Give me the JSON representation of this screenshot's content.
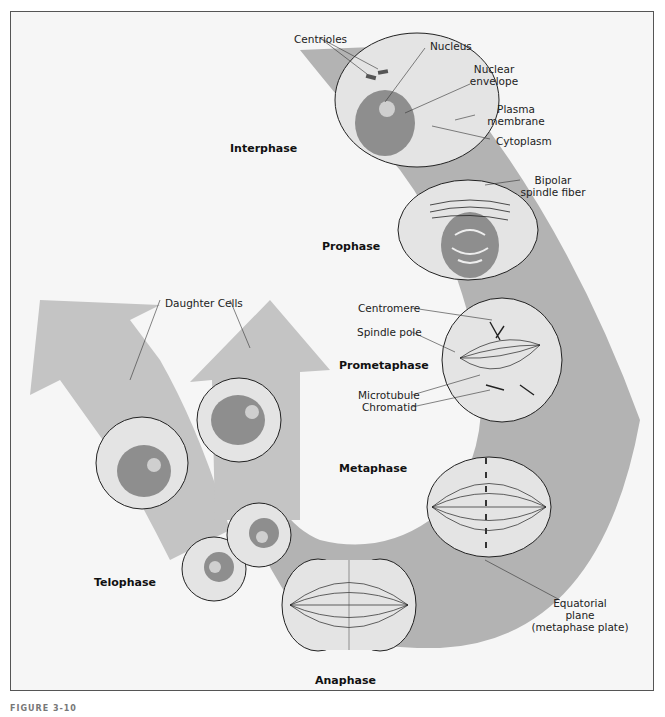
{
  "figure": {
    "caption": "FIGURE 3-10",
    "colors": {
      "background": "#f6f6f6",
      "band": "#b3b3b3",
      "arrow": "#c4c4c4",
      "cytoplasm": "#e4e4e4",
      "nucleus": "#8e8e8e",
      "outline": "#222222"
    }
  },
  "phases": {
    "interphase": "Interphase",
    "prophase": "Prophase",
    "prometaphase": "Prometaphase",
    "metaphase": "Metaphase",
    "anaphase": "Anaphase",
    "telophase": "Telophase"
  },
  "labels": {
    "centrioles": "Centrioles",
    "nucleus": "Nucleus",
    "nuclear_envelope_1": "Nuclear",
    "nuclear_envelope_2": "envelope",
    "plasma_membrane_1": "Plasma",
    "plasma_membrane_2": "membrane",
    "cytoplasm": "Cytoplasm",
    "bipolar_1": "Bipolar",
    "bipolar_2": "spindle fiber",
    "centromere": "Centromere",
    "spindle_pole": "Spindle pole",
    "microtubule": "Microtubule",
    "chromatid": "Chromatid",
    "daughter_cells": "Daughter Cells",
    "equatorial_1": "Equatorial",
    "equatorial_2": "plane",
    "equatorial_3": "(metaphase plate)"
  }
}
